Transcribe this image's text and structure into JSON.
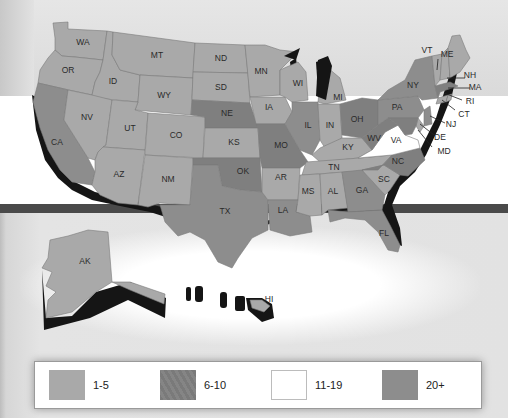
{
  "colors": {
    "range_1_5": "#a9a9a9",
    "range_6_10": "#7f7f7f",
    "range_11_19": "#ffffff",
    "range_20_plus": "#8d8d8d",
    "extrusion": "#151515",
    "background_top": "#e0e0e0",
    "background_stripe": "#4a4a4a"
  },
  "legend": {
    "items": [
      {
        "label": "1-5",
        "color": "#a9a9a9"
      },
      {
        "label": "6-10",
        "color": "#7f7f7f"
      },
      {
        "label": "11-19",
        "color": "#ffffff"
      },
      {
        "label": "20+",
        "color": "#8d8d8d"
      }
    ]
  },
  "states": {
    "WA": "WA",
    "OR": "OR",
    "CA": "CA",
    "ID": "ID",
    "NV": "NV",
    "MT": "MT",
    "WY": "WY",
    "UT": "UT",
    "AZ": "AZ",
    "CO": "CO",
    "NM": "NM",
    "ND": "ND",
    "SD": "SD",
    "NE": "NE",
    "KS": "KS",
    "OK": "OK",
    "TX": "TX",
    "MN": "MN",
    "IA": "IA",
    "MO": "MO",
    "AR": "AR",
    "LA": "LA",
    "WI": "WI",
    "IL": "IL",
    "MI": "MI",
    "IN": "IN",
    "OH": "OH",
    "KY": "KY",
    "TN": "TN",
    "MS": "MS",
    "AL": "AL",
    "GA": "GA",
    "FL": "FL",
    "SC": "SC",
    "NC": "NC",
    "VA": "VA",
    "WV": "WV",
    "PA": "PA",
    "NY": "NY",
    "VT": "VT",
    "ME": "ME",
    "NH": "NH",
    "MA": "MA",
    "RI": "RI",
    "CT": "CT",
    "NJ": "NJ",
    "DE": "DE",
    "MD": "MD",
    "AK": "AK",
    "HI": "HI"
  }
}
